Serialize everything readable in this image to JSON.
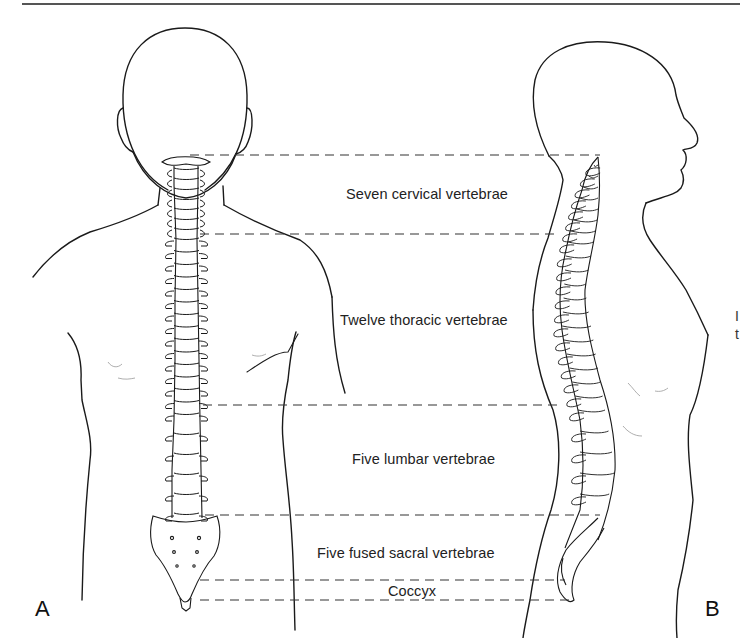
{
  "figure": {
    "panels": [
      {
        "id": "A",
        "letter": "A",
        "view": "posterior view of the spine within the torso"
      },
      {
        "id": "B",
        "letter": "B",
        "view": "lateral view of the spine within the torso"
      }
    ],
    "regions": [
      {
        "label": "Seven cervical vertebrae",
        "count": 7,
        "top_y": 155,
        "bottom_y": 234
      },
      {
        "label": "Twelve thoracic vertebrae",
        "count": 12,
        "top_y": 234,
        "bottom_y": 405
      },
      {
        "label": "Five lumbar vertebrae",
        "count": 5,
        "top_y": 405,
        "bottom_y": 515
      },
      {
        "label": "Five fused sacral vertebrae",
        "count": 5,
        "top_y": 515,
        "bottom_y": 580
      },
      {
        "label": "Coccyx",
        "count": null,
        "top_y": 580,
        "bottom_y": 600
      }
    ],
    "right_edge_fragment": {
      "line1": "I",
      "line2": "t"
    },
    "colors": {
      "ink": "#1a1a1a",
      "dash": "#333333",
      "background": "#ffffff",
      "rule": "#555555"
    }
  }
}
